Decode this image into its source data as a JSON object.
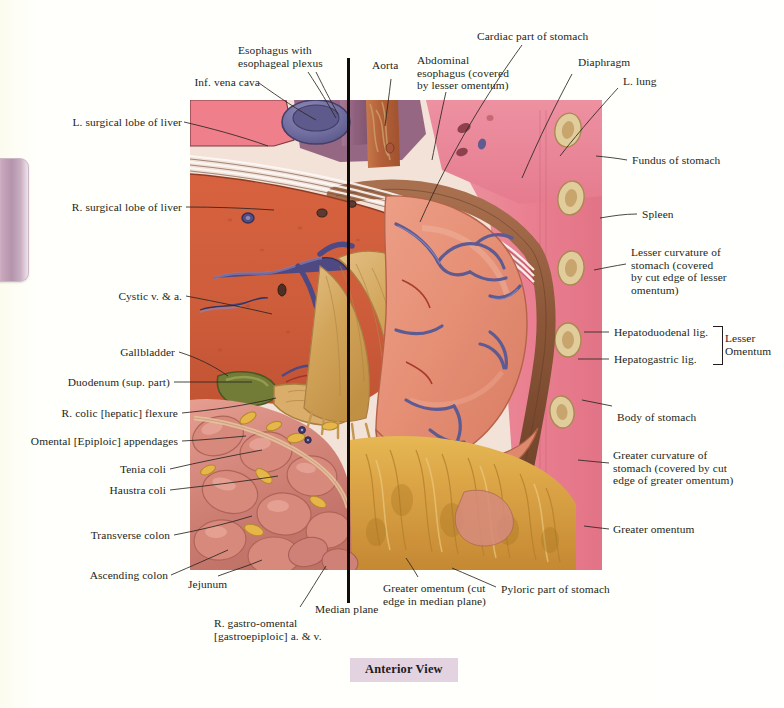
{
  "page": {
    "background_color": "#fffffb",
    "caption": "Anterior View",
    "caption_bg": "#e3d2e0",
    "tab_color": "#b494ac"
  },
  "plate": {
    "title": "Abdominal viscera — stomach, liver and greater omentum in situ",
    "median_plane_color": "#100c08",
    "palette": {
      "liver": "#d6603f",
      "stomach": "#e99279",
      "omentum": "#d8ab5e",
      "intestine": "#d98a80",
      "fat": "#e2b94e",
      "vein": "#5b5a9c",
      "lung": "#ec8196",
      "diaphragm": "#8a5a40",
      "muscle_wall": "#ef8093",
      "rib": "#e2cf9c",
      "esophagus": "#9b6b8c",
      "aorta": "#c1643a",
      "ivc": "#6f6fa6",
      "gallbladder": "#6d7a35"
    }
  },
  "labels": {
    "left": [
      {
        "id": "l-surgical-lobe-of-liver",
        "text": "L. surgical lobe of liver"
      },
      {
        "id": "r-surgical-lobe-of-liver",
        "text": "R. surgical lobe of liver"
      },
      {
        "id": "cystic-v-and-a",
        "text": "Cystic v. & a."
      },
      {
        "id": "gallbladder",
        "text": "Gallbladder"
      },
      {
        "id": "duodenum-sup-part",
        "text": "Duodenum (sup. part)"
      },
      {
        "id": "r-colic-hepatic-flexure",
        "text": "R. colic [hepatic] flexure"
      },
      {
        "id": "omental-epiploic-appendages",
        "text": "Omental [Epiploic] appendages"
      },
      {
        "id": "tenia-coli",
        "text": "Tenia coli"
      },
      {
        "id": "haustra-coli",
        "text": "Haustra coli"
      },
      {
        "id": "transverse-colon",
        "text": "Transverse colon"
      },
      {
        "id": "ascending-colon",
        "text": "Ascending colon"
      }
    ],
    "top": [
      {
        "id": "inf-vena-cava",
        "text": "Inf. vena cava"
      },
      {
        "id": "esophagus-with-plexus",
        "text": "Esophagus with\nesophageal plexus"
      },
      {
        "id": "aorta",
        "text": "Aorta"
      },
      {
        "id": "abdominal-esophagus",
        "text": "Abdominal\nesophagus (covered\nby lesser omentum)"
      },
      {
        "id": "cardiac-part-of-stomach",
        "text": "Cardiac part of stomach"
      },
      {
        "id": "diaphragm",
        "text": "Diaphragm"
      },
      {
        "id": "l-lung",
        "text": "L. lung"
      }
    ],
    "right": [
      {
        "id": "fundus-of-stomach",
        "text": "Fundus of stomach"
      },
      {
        "id": "spleen",
        "text": "Spleen"
      },
      {
        "id": "lesser-curvature",
        "text": "Lesser curvature of\nstomach (covered\nby cut edge of lesser\nomentum)"
      },
      {
        "id": "hepatoduodenal-lig",
        "text": "Hepatoduodenal lig."
      },
      {
        "id": "hepatogastric-lig",
        "text": "Hepatogastric lig."
      },
      {
        "id": "lesser-omentum",
        "text": "Lesser\nOmentum"
      },
      {
        "id": "body-of-stomach",
        "text": "Body of stomach"
      },
      {
        "id": "greater-curvature",
        "text": "Greater curvature of\nstomach (covered by cut\nedge of greater omentum)"
      },
      {
        "id": "greater-omentum",
        "text": "Greater omentum"
      }
    ],
    "bottom": [
      {
        "id": "jejunum",
        "text": "Jejunum"
      },
      {
        "id": "r-gastro-omental",
        "text": "R. gastro-omental\n[gastroepiploic] a. & v."
      },
      {
        "id": "median-plane",
        "text": "Median plane"
      },
      {
        "id": "greater-omentum-cut",
        "text": "Greater omentum (cut\nedge in median plane)"
      },
      {
        "id": "pyloric-part-of-stomach",
        "text": "Pyloric part of stomach"
      }
    ]
  }
}
